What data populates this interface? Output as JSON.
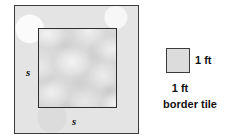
{
  "figure": {
    "outer_shape": "square",
    "inner_shape": "square",
    "border_region_label": "border tile region",
    "side_label_left": "s",
    "side_label_bottom": "s",
    "outer_fill_color": "#e4e4e4",
    "inner_fill_color": "#d8d8d8",
    "stroke_color": "#3a3a3a"
  },
  "legend": {
    "swatch_label": "border tile swatch",
    "width_label": "1 ft",
    "height_label": "1 ft",
    "caption": "border tile"
  }
}
